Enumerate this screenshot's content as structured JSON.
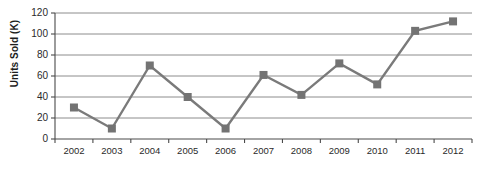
{
  "chart_data": {
    "type": "line",
    "title": "",
    "xlabel": "",
    "ylabel": "Units Sold (K)",
    "categories": [
      "2002",
      "2003",
      "2004",
      "2005",
      "2006",
      "2007",
      "2008",
      "2009",
      "2010",
      "2011",
      "2012"
    ],
    "values": [
      30,
      10,
      70,
      40,
      10,
      61,
      42,
      72,
      52,
      103,
      112
    ],
    "series": [
      {
        "name": "Units Sold",
        "values": [
          30,
          10,
          70,
          40,
          10,
          61,
          42,
          72,
          52,
          103,
          112
        ]
      }
    ],
    "ylim": [
      0,
      120
    ],
    "yticks": [
      0,
      20,
      40,
      60,
      80,
      100,
      120
    ],
    "ytick_labels": [
      "0",
      "20",
      "40",
      "60",
      "80",
      "100",
      "120"
    ],
    "grid": true,
    "legend": "none",
    "marker": "square",
    "colors": {
      "line": "#7a7a7a",
      "marker": "#737373",
      "grid": "#8c8c8c",
      "axis": "#4a4a4a",
      "text": "#2a2a2a"
    }
  }
}
